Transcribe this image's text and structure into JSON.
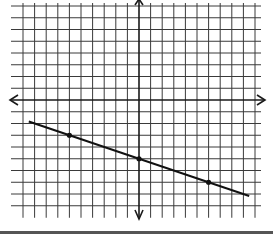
{
  "chart_data": {
    "type": "line",
    "title": "",
    "xlabel": "",
    "ylabel": "",
    "grid": true,
    "xlim": [
      -10,
      10
    ],
    "ylim": [
      -9,
      8
    ],
    "x_axis_arrows": true,
    "y_axis_arrows": true,
    "tick_labels": false,
    "series": [
      {
        "name": "line",
        "equation": "y = -x/3 - 5",
        "slope": -0.3333,
        "intercept": -5,
        "x_range": [
          -9.5,
          9.5
        ],
        "marked_points": [
          {
            "x": -6,
            "y": -3
          },
          {
            "x": 0,
            "y": -5
          },
          {
            "x": 6,
            "y": -7
          }
        ]
      }
    ]
  },
  "colors": {
    "grid": "#3a3a3a",
    "axis": "#1a1a1a",
    "line": "#111111",
    "bottom_bar": "#555555"
  }
}
